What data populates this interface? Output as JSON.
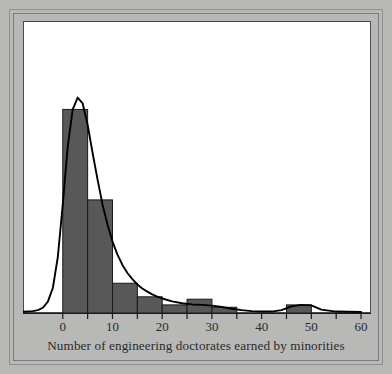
{
  "figure": {
    "caption": "Number of engineering doctorates earned by minorities",
    "frame_color": "#8e8e8e",
    "background_color": "#b8b8b7",
    "panel_color": "#ffffff",
    "bar_fill_color": "#585858",
    "bar_edge_color": "#1a1a1a",
    "curve_color": "#000000",
    "axis_color": "#1a1a1a"
  },
  "chart_data": {
    "type": "bar",
    "title": "",
    "subtitle": "",
    "xlabel": "Number of engineering doctorates earned by minorities",
    "ylabel": "",
    "grid": false,
    "legend": false,
    "bin_width": 5,
    "xlim": [
      -8,
      62
    ],
    "ylim": [
      0,
      0.105
    ],
    "axis_ticks": {
      "x_major": [
        0,
        10,
        20,
        30,
        40,
        50,
        60
      ],
      "x_major_labels": [
        "0",
        "10",
        "20",
        "30",
        "40",
        "50",
        "60"
      ],
      "x_minor": [
        5,
        15,
        25,
        35,
        45,
        55
      ]
    },
    "categories": [
      "0-5",
      "5-10",
      "10-15",
      "15-20",
      "20-25",
      "25-30",
      "30-35",
      "35-40",
      "40-45",
      "45-50",
      "50-55",
      "55-60"
    ],
    "bin_edges": [
      0,
      5,
      10,
      15,
      20,
      25,
      30,
      35,
      40,
      45,
      50,
      55,
      60
    ],
    "values": [
      0.0855,
      0.0475,
      0.0125,
      0.0068,
      0.0034,
      0.0058,
      0.0024,
      0.0,
      0.0,
      0.0034,
      0.0,
      0.0
    ],
    "series": [
      {
        "name": "Density curve",
        "type": "line",
        "x": [
          -8,
          -6,
          -5,
          -4,
          -3,
          -2,
          -1,
          0,
          1,
          2,
          3,
          4,
          5,
          6,
          7,
          8,
          9,
          10,
          11,
          12,
          13,
          14,
          15,
          16,
          17,
          18,
          19,
          20,
          22,
          24,
          26,
          28,
          30,
          32,
          34,
          36,
          38,
          40,
          42,
          44,
          46,
          48,
          50,
          52,
          55,
          60
        ],
        "y": [
          0.0005,
          0.0008,
          0.0012,
          0.0022,
          0.0048,
          0.0105,
          0.0235,
          0.0455,
          0.07,
          0.0855,
          0.0905,
          0.088,
          0.079,
          0.0672,
          0.056,
          0.0455,
          0.0372,
          0.03,
          0.0245,
          0.0202,
          0.0168,
          0.0142,
          0.012,
          0.0103,
          0.009,
          0.0078,
          0.0069,
          0.0061,
          0.0049,
          0.0041,
          0.0036,
          0.0034,
          0.0031,
          0.0025,
          0.0018,
          0.0012,
          0.0008,
          0.0006,
          0.0006,
          0.0012,
          0.0028,
          0.0034,
          0.0032,
          0.0014,
          0.0006,
          0.0004
        ]
      }
    ]
  }
}
